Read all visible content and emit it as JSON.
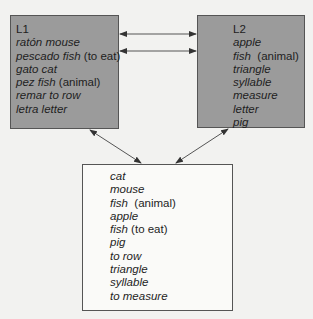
{
  "diagram": {
    "l1": {
      "title": "L1",
      "entries": [
        {
          "word": "ratón",
          "gloss": "mouse",
          "note": ""
        },
        {
          "word": "pescado",
          "gloss": "fish",
          "note": "(to eat)"
        },
        {
          "word": "gato",
          "gloss": "cat",
          "note": ""
        },
        {
          "word": "pez",
          "gloss": "fish",
          "note": "(animal)"
        },
        {
          "word": "remar",
          "gloss": "to row",
          "note": ""
        },
        {
          "word": "letra",
          "gloss": "letter",
          "note": ""
        }
      ]
    },
    "l2": {
      "title": "L2",
      "entries": [
        {
          "word": "apple",
          "note": ""
        },
        {
          "word": "fish",
          "note": "(animal)"
        },
        {
          "word": "triangle",
          "note": ""
        },
        {
          "word": "syllable",
          "note": ""
        },
        {
          "word": "measure",
          "note": ""
        },
        {
          "word": "letter",
          "note": ""
        },
        {
          "word": "pig",
          "note": ""
        }
      ]
    },
    "concepts": {
      "entries": [
        {
          "word": "cat",
          "note": ""
        },
        {
          "word": "mouse",
          "note": ""
        },
        {
          "word": "fish",
          "note": "(animal)"
        },
        {
          "word": "apple",
          "note": ""
        },
        {
          "word": "fish",
          "note": "(to eat)"
        },
        {
          "word": "pig",
          "note": ""
        },
        {
          "word": "to row",
          "note": ""
        },
        {
          "word": "triangle",
          "note": ""
        },
        {
          "word": "syllable",
          "note": ""
        },
        {
          "word": "to measure",
          "note": ""
        }
      ]
    },
    "arrows": [
      {
        "from": "L1",
        "to": "L2",
        "type": "bidirectional"
      },
      {
        "from": "L1",
        "to": "L2",
        "type": "bidirectional"
      },
      {
        "from": "L1",
        "to": "concepts",
        "type": "bidirectional"
      },
      {
        "from": "L2",
        "to": "concepts",
        "type": "bidirectional"
      }
    ],
    "colors": {
      "lexicon_fill": "#9b9b9b",
      "concept_fill": "#fafaf8",
      "background": "#f2f2f0",
      "line": "#444444"
    }
  }
}
